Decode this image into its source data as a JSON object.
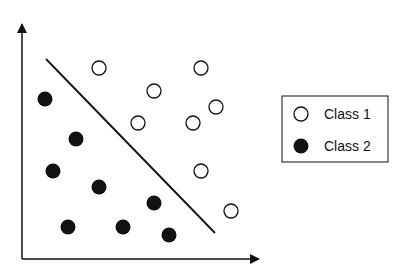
{
  "chart_data": {
    "type": "scatter",
    "title": "",
    "xlabel": "",
    "ylabel": "",
    "grid": false,
    "legend_position": "right",
    "decision_boundary": {
      "x1": 46,
      "y1": 59,
      "x2": 215,
      "y2": 233
    },
    "series": [
      {
        "name": "Class 1",
        "marker": "open-circle",
        "points": [
          [
            99,
            68
          ],
          [
            201,
            68
          ],
          [
            154,
            91
          ],
          [
            216,
            107
          ],
          [
            138,
            123
          ],
          [
            193,
            123
          ],
          [
            201,
            171
          ],
          [
            231,
            211
          ]
        ]
      },
      {
        "name": "Class 2",
        "marker": "filled-circle",
        "points": [
          [
            45,
            99
          ],
          [
            76,
            139
          ],
          [
            53,
            171
          ],
          [
            99,
            187
          ],
          [
            154,
            203
          ],
          [
            68,
            227
          ],
          [
            123,
            227
          ],
          [
            169,
            235
          ]
        ]
      }
    ]
  },
  "legend": {
    "items": [
      {
        "label": "Class 1",
        "marker": "open-circle"
      },
      {
        "label": "Class 2",
        "marker": "filled-circle"
      }
    ]
  },
  "colors": {
    "ink": "#111111",
    "background": "#ffffff"
  }
}
